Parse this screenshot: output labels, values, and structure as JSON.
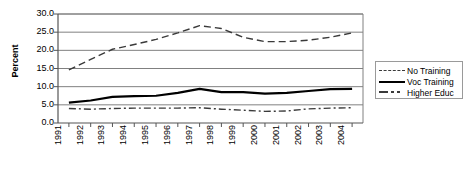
{
  "chart_data": {
    "type": "line",
    "title": "",
    "xlabel": "",
    "ylabel": "Percent",
    "ylim": [
      0.0,
      30.0
    ],
    "ytick_step": 5.0,
    "grid": true,
    "legend_position": "right",
    "categories": [
      "1991",
      "1992",
      "1993",
      "1994",
      "1995",
      "1996",
      "1997",
      "1998",
      "1999",
      "2000",
      "2001",
      "2002",
      "2003",
      "2004"
    ],
    "ytick_labels": [
      "30.0",
      "25.0",
      "20.0",
      "15.0",
      "10.0",
      "5.0",
      "0.0"
    ],
    "series": [
      {
        "name": "No Training",
        "style": "dashed",
        "color": "#3a3a3a",
        "values": [
          14.6,
          17.5,
          20.3,
          21.6,
          23.0,
          24.8,
          26.8,
          26.0,
          23.6,
          22.4,
          22.4,
          22.8,
          23.6,
          24.8
        ]
      },
      {
        "name": "Voc Training",
        "style": "solid",
        "color": "#000000",
        "values": [
          5.6,
          6.2,
          7.2,
          7.4,
          7.5,
          8.3,
          9.4,
          8.5,
          8.5,
          8.1,
          8.3,
          8.8,
          9.3,
          9.4
        ]
      },
      {
        "name": "Higher Educ",
        "style": "dash-dot",
        "color": "#3a3a3a",
        "values": [
          4.0,
          3.8,
          4.0,
          4.1,
          4.1,
          4.1,
          4.2,
          3.8,
          3.5,
          3.2,
          3.3,
          3.9,
          4.1,
          4.2
        ]
      }
    ]
  },
  "legend": {
    "items": [
      {
        "label": "No Training"
      },
      {
        "label": "Voc Training"
      },
      {
        "label": "Higher Educ"
      }
    ]
  }
}
